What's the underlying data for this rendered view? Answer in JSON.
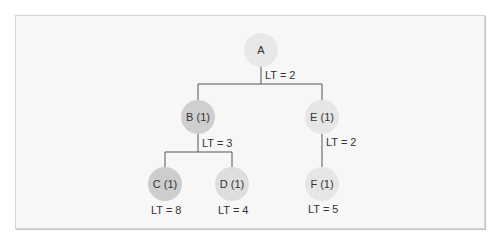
{
  "diagram": {
    "type": "tree",
    "nodes": [
      {
        "id": "A",
        "label": "A",
        "fill": "#e8e8e8"
      },
      {
        "id": "B",
        "label": "B (1)",
        "fill": "#cfcfcf"
      },
      {
        "id": "E",
        "label": "E (1)",
        "fill": "#e6e6e6"
      },
      {
        "id": "C",
        "label": "C (1)",
        "fill": "#cdcdcd"
      },
      {
        "id": "D",
        "label": "D (1)",
        "fill": "#dedede"
      },
      {
        "id": "F",
        "label": "F (1)",
        "fill": "#e6e6e6"
      }
    ],
    "edges": [
      {
        "from": "A",
        "to": "B"
      },
      {
        "from": "A",
        "to": "E"
      },
      {
        "from": "B",
        "to": "C"
      },
      {
        "from": "B",
        "to": "D"
      },
      {
        "from": "E",
        "to": "F"
      }
    ],
    "lead_time_labels": {
      "A": "LT = 2",
      "B": "LT = 3",
      "E": "LT = 2",
      "C": "LT = 8",
      "D": "LT = 4",
      "F": "LT = 5"
    }
  }
}
